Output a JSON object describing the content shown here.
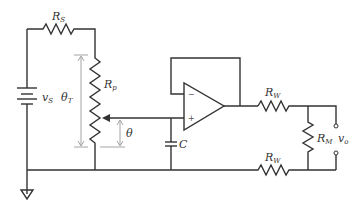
{
  "diagram": {
    "type": "circuit-schematic",
    "components": {
      "source": {
        "label": "v",
        "sub": "S"
      },
      "series_resistor": {
        "label": "R",
        "sub": "S"
      },
      "potentiometer": {
        "label": "R",
        "sub": "p"
      },
      "capacitor": {
        "label": "C"
      },
      "wire_resistor_top": {
        "label": "R",
        "sub": "W"
      },
      "wire_resistor_bottom": {
        "label": "R",
        "sub": "W"
      },
      "meter_resistor": {
        "label": "R",
        "sub": "M"
      },
      "output": {
        "label": "v",
        "sub": "o"
      },
      "opamp": {
        "minus": "−",
        "plus": "+"
      }
    },
    "dimensions": {
      "total_angle": {
        "label": "θ",
        "sub": "T"
      },
      "wiper_angle": {
        "label": "θ"
      }
    }
  }
}
